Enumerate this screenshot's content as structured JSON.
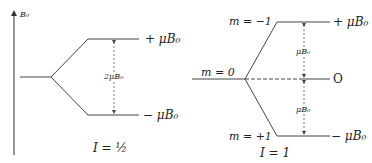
{
  "left_diagram": {
    "axis_label": "B₀",
    "upper_label": "+ μB₀",
    "lower_label": "− μB₀",
    "gap_label": "2μB₀",
    "spin_label": "I = ½"
  },
  "right_diagram": {
    "m_upper": "m = −1",
    "m_middle": "m = 0",
    "m_lower": "m = +1",
    "upper_label": "+ μB₀",
    "middle_label": "O",
    "lower_label": "− μB₀",
    "gap_upper_label": "μB₀",
    "gap_lower_label": "μB₀",
    "spin_label": "I = 1"
  }
}
